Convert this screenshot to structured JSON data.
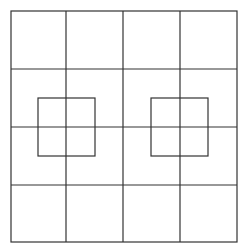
{
  "figure": {
    "stroke_color": "#333333",
    "background": "#ffffff",
    "outer_frame": {
      "x": 11,
      "y": 11,
      "width": 226,
      "height": 231
    },
    "grid": {
      "rows": 4,
      "cols": 4,
      "vertical_lines_x": [
        66,
        123,
        180
      ],
      "horizontal_lines_y": [
        69,
        127,
        185
      ]
    },
    "overlay_squares": [
      {
        "x": 38,
        "y": 98,
        "width": 57,
        "height": 58
      },
      {
        "x": 151,
        "y": 98,
        "width": 57,
        "height": 58
      }
    ]
  }
}
